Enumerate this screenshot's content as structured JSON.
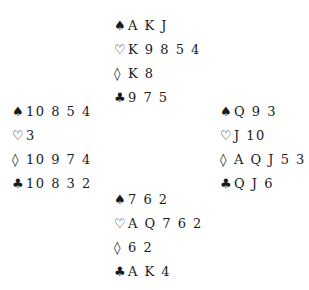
{
  "suits": {
    "spades": "♠",
    "hearts": "♡",
    "diamonds": "◊",
    "clubs": "♣"
  },
  "hands": {
    "north": {
      "spades": "A K J",
      "hearts": "K 9 8 5 4",
      "diamonds": "K 8",
      "clubs": "9 7 5"
    },
    "west": {
      "spades": "10 8 5 4",
      "hearts": "3",
      "diamonds": "10 9 7 4",
      "clubs": "10 8 3 2"
    },
    "east": {
      "spades": "Q 9 3",
      "hearts": "J 10",
      "diamonds": "A Q J 5 3",
      "clubs": "Q J 6"
    },
    "south": {
      "spades": "7 6 2",
      "hearts": "A Q 7 6 2",
      "diamonds": "6 2",
      "clubs": "A K 4"
    }
  }
}
